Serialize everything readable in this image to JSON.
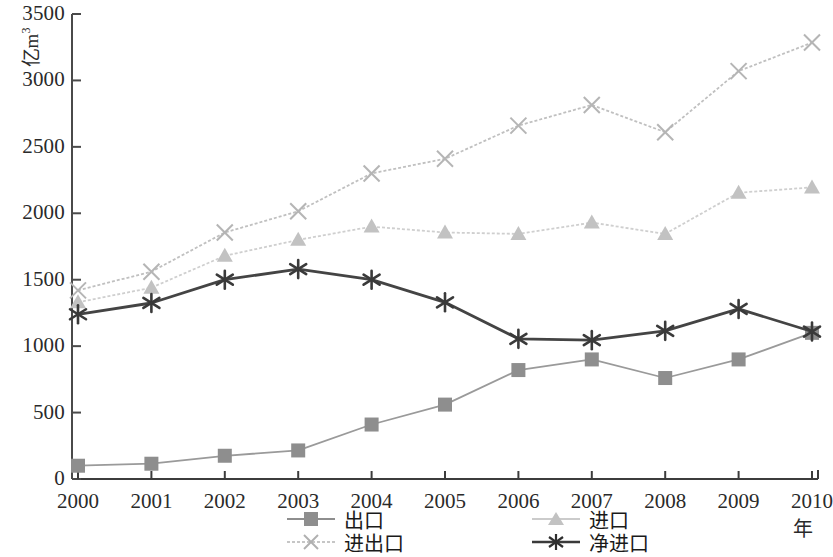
{
  "chart_data": {
    "type": "line",
    "title": "",
    "xlabel": "年",
    "ylabel": "亿m3",
    "ylabel_base": "亿m",
    "ylabel_sup": "3",
    "x": [
      2000,
      2001,
      2002,
      2003,
      2004,
      2005,
      2006,
      2007,
      2008,
      2009,
      2010
    ],
    "categories": [
      "2000",
      "2001",
      "2002",
      "2003",
      "2004",
      "2005",
      "2006",
      "2007",
      "2008",
      "2009",
      "2010"
    ],
    "xlim": [
      2000,
      2010
    ],
    "ylim": [
      0,
      3500
    ],
    "ytick_values": [
      0,
      500,
      1000,
      1500,
      2000,
      2500,
      3000,
      3500
    ],
    "ytick_labels": [
      "0",
      "500",
      "1000",
      "1500",
      "2000",
      "2500",
      "3000",
      "3500"
    ],
    "grid": false,
    "legend_position": "bottom",
    "series": [
      {
        "name": "出口",
        "key": "export",
        "marker": "square",
        "color": "#8e8e8e",
        "line_color": "#9a9a9a",
        "line_style": "solid",
        "values": [
          100,
          115,
          175,
          215,
          410,
          560,
          820,
          900,
          760,
          900,
          1100
        ]
      },
      {
        "name": "进口",
        "key": "import",
        "marker": "triangle",
        "color": "#c2c2c2",
        "line_color": "#cfcfcf",
        "line_style": "dotted",
        "values": [
          1330,
          1440,
          1680,
          1800,
          1900,
          1855,
          1845,
          1930,
          1845,
          2155,
          2195
        ]
      },
      {
        "name": "进出口",
        "key": "total",
        "marker": "x",
        "color": "#b5b5b5",
        "line_color": "#c0c0c0",
        "line_style": "dotted",
        "values": [
          1420,
          1560,
          1855,
          2015,
          2300,
          2410,
          2660,
          2815,
          2610,
          3070,
          3285
        ]
      },
      {
        "name": "净进口",
        "key": "net",
        "marker": "asterisk",
        "color": "#3a3a3a",
        "line_color": "#444444",
        "line_style": "solid",
        "values": [
          1240,
          1325,
          1500,
          1580,
          1500,
          1330,
          1055,
          1045,
          1115,
          1280,
          1110
        ]
      }
    ]
  },
  "axis": {
    "y_title": "亿m",
    "y_title_sup": "3",
    "x_title": "年"
  },
  "legend": {
    "items": [
      {
        "label": "出口",
        "marker": "square-marker"
      },
      {
        "label": "进口",
        "marker": "triangle-marker"
      },
      {
        "label": "进出口",
        "marker": "x-marker"
      },
      {
        "label": "净进口",
        "marker": "asterisk-marker"
      }
    ]
  }
}
